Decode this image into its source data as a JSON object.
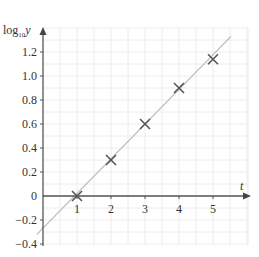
{
  "chart_data": {
    "type": "scatter",
    "title": "",
    "xlabel": "t",
    "ylabel": "log10 y",
    "ylabel_parts": {
      "base": "log",
      "sub": "10",
      "var": "y"
    },
    "x": [
      1,
      2,
      3,
      4,
      5
    ],
    "series": [
      {
        "name": "data points",
        "marker": "x",
        "values": [
          0.0,
          0.3,
          0.6,
          0.9,
          1.14
        ]
      },
      {
        "name": "line of best fit",
        "type": "line",
        "x": [
          -0.18,
          5.53
        ],
        "values": [
          -0.32,
          1.33
        ]
      }
    ],
    "x_ticks": [
      "1",
      "2",
      "3",
      "4",
      "5"
    ],
    "y_ticks": [
      "-0.4",
      "-0.2",
      "0",
      "0.2",
      "0.4",
      "0.6",
      "0.8",
      "1.0",
      "1.2"
    ],
    "xlim": [
      -0.1,
      6.0
    ],
    "ylim": [
      -0.42,
      1.4
    ],
    "grid": true,
    "legend": "none",
    "colors": {
      "axis": "#555555",
      "grid": "#ececec",
      "line": "#bbbbbb",
      "marker": "#555555",
      "text": "#333333"
    }
  },
  "labels": {
    "x_axis": "t",
    "y_axis_base": "log",
    "y_axis_sub": "10",
    "y_axis_var": "y",
    "zero": "0"
  }
}
